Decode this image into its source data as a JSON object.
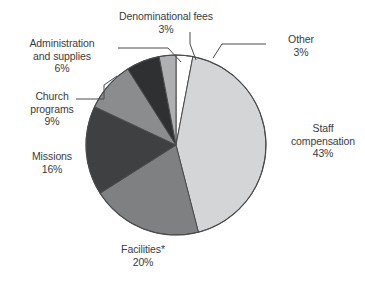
{
  "chart_data": {
    "type": "pie",
    "title": "",
    "subtitle": "",
    "xlabel": "",
    "ylabel": "",
    "legend_position": "none",
    "grid": false,
    "value_unit": "%",
    "categories": [
      "Other",
      "Staff compensation",
      "Facilities*",
      "Missions",
      "Church programs",
      "Administration and supplies",
      "Denominational fees"
    ],
    "values": [
      3,
      43,
      20,
      16,
      9,
      6,
      3
    ],
    "slices": [
      {
        "id": "other",
        "label": "Other",
        "label_line1": "Other",
        "label_line2": "",
        "value": 3,
        "value_text": "3%",
        "color": "#FFFFFF",
        "start_angle": 0,
        "end_angle": 10.8
      },
      {
        "id": "staff-compensation",
        "label": "Staff compensation",
        "label_line1": "Staff",
        "label_line2": "compensation",
        "value": 43,
        "value_text": "43%",
        "color": "#D3D5D6",
        "start_angle": 10.8,
        "end_angle": 165.6
      },
      {
        "id": "facilities",
        "label": "Facilities*",
        "label_line1": "Facilities*",
        "label_line2": "",
        "value": 20,
        "value_text": "20%",
        "color": "#7E8082",
        "start_angle": 165.6,
        "end_angle": 237.6
      },
      {
        "id": "missions",
        "label": "Missions",
        "label_line1": "Missions",
        "label_line2": "",
        "value": 16,
        "value_text": "16%",
        "color": "#3E4042",
        "start_angle": 237.6,
        "end_angle": 295.2
      },
      {
        "id": "church-programs",
        "label": "Church programs",
        "label_line1": "Church",
        "label_line2": "programs",
        "value": 9,
        "value_text": "9%",
        "color": "#8A8C8E",
        "start_angle": 295.2,
        "end_angle": 327.6
      },
      {
        "id": "administration-and-supplies",
        "label": "Administration and supplies",
        "label_line1": "Administration",
        "label_line2": "and supplies",
        "value": 6,
        "value_text": "6%",
        "color": "#2E3032",
        "start_angle": 327.6,
        "end_angle": 349.2
      },
      {
        "id": "denominational-fees",
        "label": "Denominational fees",
        "label_line1": "Denominational fees",
        "label_line2": "",
        "value": 3,
        "value_text": "3%",
        "color": "#AEB0B2",
        "start_angle": 349.2,
        "end_angle": 360
      }
    ]
  },
  "labels": {
    "denominational": {
      "name": "Denominational fees",
      "pct": "3%"
    },
    "other": {
      "name": "Other",
      "pct": "3%"
    },
    "administration": {
      "name_line1": "Administration",
      "name_line2": "and supplies",
      "pct": "6%"
    },
    "church": {
      "name_line1": "Church",
      "name_line2": "programs",
      "pct": "9%"
    },
    "missions": {
      "name": "Missions",
      "pct": "16%"
    },
    "facilities": {
      "name": "Facilities*",
      "pct": "20%"
    },
    "staff": {
      "name_line1": "Staff",
      "name_line2": "compensation",
      "pct": "43%"
    }
  },
  "style": {
    "outline_color": "#4a4a4a",
    "leader_color": "#4a4a4a",
    "background": "#FFFFFF",
    "text_color": "#3b3b3b"
  }
}
